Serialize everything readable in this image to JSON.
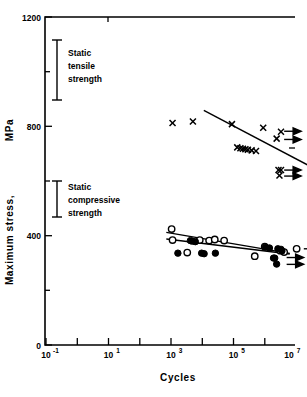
{
  "chart_data": {
    "type": "scatter",
    "title": "",
    "xlabel": "Cycles",
    "ylabel": "Maximum stress,  MPa",
    "ylabel_plain": "Maximum stress, MPa",
    "xscale": "log",
    "yscale": "linear",
    "xlim_exp": [
      -1,
      7.9
    ],
    "ylim": [
      0,
      1200
    ],
    "grid": false,
    "legend": "none",
    "y_ticks_major": [
      0,
      400,
      800,
      1200
    ],
    "y_tick_labels": [
      "0",
      "400",
      "800",
      "1200"
    ],
    "y_ticks_minor": [
      200,
      600,
      1000
    ],
    "x_ticks_major_exp": [
      -1,
      1,
      3,
      5,
      7
    ],
    "x_tick_labels": [
      "10⁻¹",
      "10¹",
      "10³",
      "10⁵",
      "10⁷"
    ],
    "x_tick_mantissas": [
      "10",
      "10",
      "10",
      "10",
      "10"
    ],
    "x_tick_exponents": [
      "-1",
      "1",
      "3",
      "5",
      "7"
    ],
    "x_ticks_minor_exp": [
      0,
      2,
      4,
      6
    ],
    "series": [
      {
        "name": "Tension fatigue (X markers)",
        "marker": "x",
        "points": [
          {
            "x_exp": 3.05,
            "y": 812
          },
          {
            "x_exp": 3.7,
            "y": 818
          },
          {
            "x_exp": 4.95,
            "y": 808
          },
          {
            "x_exp": 5.12,
            "y": 723
          },
          {
            "x_exp": 5.22,
            "y": 720
          },
          {
            "x_exp": 5.3,
            "y": 718
          },
          {
            "x_exp": 5.38,
            "y": 716
          },
          {
            "x_exp": 5.46,
            "y": 714
          },
          {
            "x_exp": 5.58,
            "y": 712
          },
          {
            "x_exp": 5.72,
            "y": 710
          },
          {
            "x_exp": 5.95,
            "y": 795
          },
          {
            "x_exp": 6.52,
            "y": 780
          },
          {
            "x_exp": 6.38,
            "y": 755
          },
          {
            "x_exp": 6.44,
            "y": 640
          },
          {
            "x_exp": 6.52,
            "y": 640
          },
          {
            "x_exp": 6.47,
            "y": 620
          }
        ]
      },
      {
        "name": "Compression fatigue (open circles)",
        "marker": "o-open",
        "points": [
          {
            "x_exp": 3.02,
            "y": 424
          },
          {
            "x_exp": 3.05,
            "y": 384
          },
          {
            "x_exp": 3.52,
            "y": 338
          },
          {
            "x_exp": 3.92,
            "y": 384
          },
          {
            "x_exp": 4.22,
            "y": 382
          },
          {
            "x_exp": 4.4,
            "y": 386
          },
          {
            "x_exp": 4.7,
            "y": 382
          },
          {
            "x_exp": 5.68,
            "y": 325
          },
          {
            "x_exp": 6.0,
            "y": 360
          },
          {
            "x_exp": 6.5,
            "y": 345
          },
          {
            "x_exp": 6.62,
            "y": 340
          },
          {
            "x_exp": 7.02,
            "y": 352
          }
        ]
      },
      {
        "name": "Compression fatigue (filled circles)",
        "marker": "o-filled",
        "points": [
          {
            "x_exp": 3.22,
            "y": 336
          },
          {
            "x_exp": 3.62,
            "y": 382
          },
          {
            "x_exp": 3.68,
            "y": 380
          },
          {
            "x_exp": 3.78,
            "y": 378
          },
          {
            "x_exp": 3.98,
            "y": 336
          },
          {
            "x_exp": 4.06,
            "y": 334
          },
          {
            "x_exp": 4.42,
            "y": 336
          },
          {
            "x_exp": 6.02,
            "y": 358
          },
          {
            "x_exp": 6.15,
            "y": 355
          },
          {
            "x_exp": 6.28,
            "y": 318
          },
          {
            "x_exp": 6.42,
            "y": 352
          },
          {
            "x_exp": 6.52,
            "y": 350
          },
          {
            "x_exp": 6.55,
            "y": 344
          },
          {
            "x_exp": 6.38,
            "y": 296
          },
          {
            "x_exp": 6.32,
            "y": 318
          }
        ]
      }
    ],
    "fit_lines": [
      {
        "name": "tension-fit",
        "x1_exp": 4.05,
        "y1": 858,
        "x2_exp": 7.6,
        "y2": 645
      },
      {
        "name": "compression-fit-upper",
        "x1_exp": 2.85,
        "y1": 412,
        "x2_exp": 6.8,
        "y2": 335
      },
      {
        "name": "compression-fit-lower",
        "x1_exp": 2.85,
        "y1": 388,
        "x2_exp": 6.8,
        "y2": 333
      }
    ],
    "runout_arrows": [
      {
        "group": "tension",
        "x_exp": 6.62,
        "y": 782
      },
      {
        "group": "tension",
        "x_exp": 6.62,
        "y": 752
      },
      {
        "group": "tension",
        "x_exp": 6.62,
        "y": 640
      },
      {
        "group": "tension",
        "x_exp": 6.62,
        "y": 618
      },
      {
        "group": "compression",
        "x_exp": 7.25,
        "y": 352
      },
      {
        "group": "compression",
        "x_exp": 6.7,
        "y": 320
      },
      {
        "group": "compression",
        "x_exp": 6.7,
        "y": 295
      }
    ],
    "annotations": [
      {
        "name": "static-tensile-strength",
        "lines": [
          "Static",
          "tensile",
          "strength"
        ],
        "text": "Static tensile strength",
        "bar_low": 860,
        "bar_high": 1080,
        "bar_x_exp": 0.35
      },
      {
        "name": "static-compressive-strength",
        "lines": [
          "Static",
          "compressive",
          "strength"
        ],
        "text": "Static compressive strength",
        "bar_low": 406,
        "bar_high": 538,
        "bar_x_exp": 0.35
      }
    ]
  },
  "axes": {
    "x_title": "Cycles",
    "y_title_part1": "Maximum stress,",
    "y_title_part2": "MPa"
  },
  "colors": {
    "ink": "#000000",
    "background": "#ffffff"
  }
}
